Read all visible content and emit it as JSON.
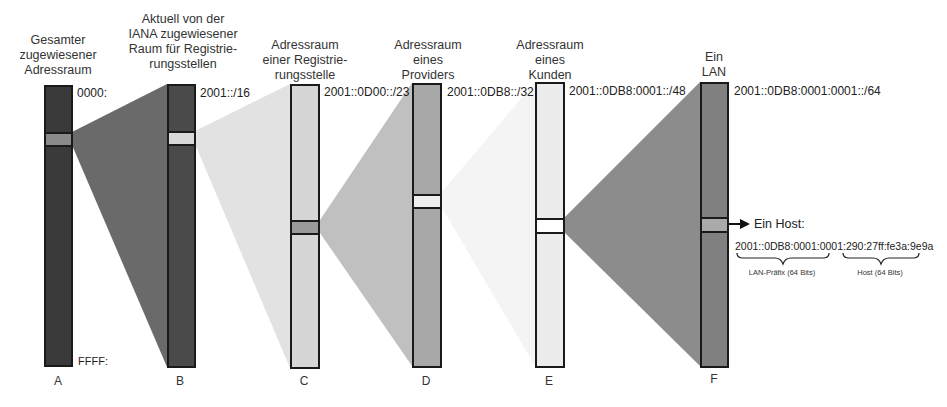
{
  "diagram": {
    "type": "ipv6-address-hierarchy",
    "colors": {
      "bar_A": "#3a3a3a",
      "bar_B": "#4a4a4a",
      "bar_C": "#d6d6d6",
      "bar_D": "#a8a8a8",
      "bar_E": "#ececec",
      "bar_F": "#808080",
      "wedge_AB": "#6a6a6a",
      "wedge_BC": "#e2e2e2",
      "wedge_CD": "#c0c0c0",
      "wedge_DE": "#f4f4f4",
      "wedge_EF": "#8c8c8c"
    },
    "columns": [
      {
        "id": "A",
        "letter": "A",
        "title": "Gesamter\nzugewiesener\nAdressraum",
        "top_label": "0000:",
        "bottom_label": "FFFF:"
      },
      {
        "id": "B",
        "letter": "B",
        "title": "Aktuell von der\nIANA zugewiesener\nRaum für Registrie-\nrungsstellen",
        "top_label": "2001::/16"
      },
      {
        "id": "C",
        "letter": "C",
        "title": "Adressraum\neiner Registrie-\nrungsstelle",
        "top_label": "2001::0D00::/23"
      },
      {
        "id": "D",
        "letter": "D",
        "title": "Adressraum\neines\nProviders",
        "top_label": "2001::0DB8::/32"
      },
      {
        "id": "E",
        "letter": "E",
        "title": "Adressraum\neines\nKunden",
        "top_label": "2001::0DB8:0001::/48"
      },
      {
        "id": "F",
        "letter": "F",
        "title": "Ein\nLAN",
        "top_label": "2001::0DB8:0001:0001::/64"
      }
    ],
    "host": {
      "label": "Ein Host:",
      "address": "2001::0DB8:0001:0001:290:27ff:fe3a:9e9a",
      "prefix_brace_label": "LAN-Präfix (64 Bits)",
      "host_brace_label": "Host (64 Bits)"
    }
  }
}
